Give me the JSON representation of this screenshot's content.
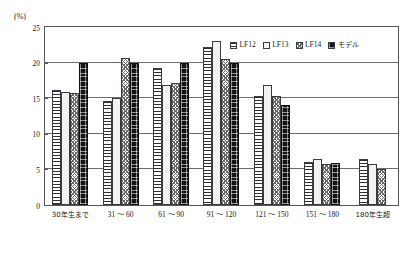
{
  "chart_data": {
    "type": "bar",
    "title": "",
    "subtitle": "",
    "xlabel": "",
    "ylabel": "(%)",
    "ylim": [
      0,
      25
    ],
    "ytick_labels": [
      "0",
      "5",
      "10",
      "15",
      "20",
      "25"
    ],
    "ytick_values": [
      0,
      5,
      10,
      15,
      20,
      25
    ],
    "grid": true,
    "legend_position": "top-right",
    "categories": [
      "30年生まで",
      "31 ～ 60",
      "61 ～ 90",
      "91 ～ 120",
      "121 ～ 150",
      "151 ～ 180",
      "180年生超"
    ],
    "series": [
      {
        "name": "LF12",
        "pattern": "horizontal-stripes",
        "values": [
          16.1,
          14.6,
          19.2,
          22.2,
          15.3,
          6.1,
          6.4
        ]
      },
      {
        "name": "LF13",
        "pattern": "solid-white",
        "values": [
          15.9,
          15.1,
          16.8,
          23.0,
          16.8,
          6.4,
          5.8
        ]
      },
      {
        "name": "LF14",
        "pattern": "checkered",
        "values": [
          15.7,
          20.7,
          17.2,
          20.5,
          15.3,
          5.8,
          5.1
        ]
      },
      {
        "name": "モデル",
        "pattern": "black-dotted",
        "values": [
          20.0,
          20.0,
          20.0,
          20.0,
          14.1,
          5.9,
          null
        ]
      }
    ]
  },
  "legend": {
    "items": [
      {
        "label": "LF12"
      },
      {
        "label": "LF13"
      },
      {
        "label": "LF14"
      },
      {
        "label": "モデル"
      }
    ]
  },
  "colors": {
    "axis": "#55565a",
    "grid": "#6c6d70",
    "bar_outline": "#3a3b3e",
    "model_fill": "#141414",
    "lf13_fill": "#f2f2f1",
    "background": "#ffffff"
  }
}
